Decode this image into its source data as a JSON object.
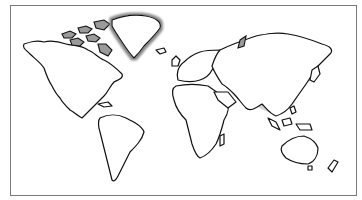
{
  "map": {
    "type": "world-outline",
    "projection": "equirectangular-like",
    "highlighted_region": {
      "name": "South and East Asia band",
      "color": "#d4d4d4"
    },
    "arctic_shading_color": "#9a9a9a",
    "outline_color": "#111111",
    "frame_color": "#7a7a7a",
    "background_color": "#ffffff",
    "labels": []
  }
}
